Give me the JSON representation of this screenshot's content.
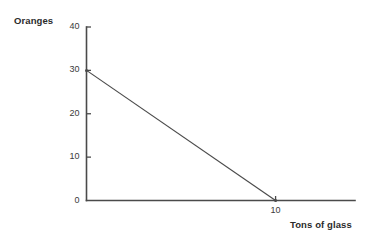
{
  "chart_data": {
    "type": "line",
    "title": "",
    "xlabel": "Tons of glass",
    "ylabel": "Oranges",
    "xlim": [
      0,
      14.2
    ],
    "ylim": [
      0,
      40
    ],
    "grid": false,
    "legend": null,
    "x_ticks": [
      10
    ],
    "x_tick_labels": [
      "10"
    ],
    "y_ticks": [
      0,
      10,
      20,
      30,
      40
    ],
    "y_tick_labels": [
      "0",
      "10",
      "20",
      "30",
      "40"
    ],
    "series": [
      {
        "name": "Production possibility frontier",
        "x": [
          0,
          10
        ],
        "values": [
          30,
          0
        ],
        "color": "#4a4a4a"
      }
    ],
    "annotations": []
  },
  "labels": {
    "y_axis_title": "Oranges",
    "x_axis_title": "Tons of glass"
  },
  "colors": {
    "background": "#ffffff",
    "axis": "#4a4a4a",
    "line": "#4a4a4a",
    "tick_text": "#3a3a3a",
    "title_text": "#2b2b2b"
  }
}
